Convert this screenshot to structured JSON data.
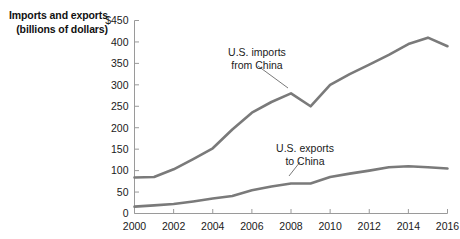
{
  "axis_title": {
    "line1": "Imports and exports",
    "line2": "(billions of dollars)"
  },
  "chart_data": {
    "type": "line",
    "title": "",
    "xlabel": "",
    "ylabel": "Imports and exports (billions of dollars)",
    "xlim": [
      2000,
      2016
    ],
    "ylim": [
      0,
      450
    ],
    "grid": false,
    "legend": "annotations-on-plot",
    "line_color": "#7a7a7a",
    "axis_color": "#9a9a9a",
    "x": [
      2000,
      2001,
      2002,
      2003,
      2004,
      2005,
      2006,
      2007,
      2008,
      2009,
      2010,
      2011,
      2012,
      2013,
      2014,
      2015,
      2016
    ],
    "xticks": [
      "2000",
      "2002",
      "2004",
      "2006",
      "2008",
      "2010",
      "2012",
      "2014",
      "2016"
    ],
    "yticks": [
      "$450",
      "400",
      "350",
      "300",
      "250",
      "200",
      "150",
      "100",
      "50",
      "0"
    ],
    "ytick_values": [
      450,
      400,
      350,
      300,
      250,
      200,
      150,
      100,
      50,
      0
    ],
    "series": [
      {
        "name": "U.S. imports from China",
        "values": [
          84,
          85,
          103,
          127,
          152,
          196,
          235,
          260,
          280,
          250,
          300,
          325,
          347,
          370,
          395,
          410,
          390
        ]
      },
      {
        "name": "U.S. exports to China",
        "values": [
          16,
          19,
          22,
          28,
          35,
          41,
          54,
          63,
          70,
          70,
          85,
          93,
          100,
          108,
          110,
          108,
          105
        ]
      }
    ],
    "annotations": [
      {
        "label_line1": "U.S. imports",
        "label_line2": "from China",
        "target_year": 2008,
        "target_value": 280
      },
      {
        "label_line1": "U.S. exports",
        "label_line2": "to China",
        "target_year": 2010,
        "target_value": 85
      }
    ]
  }
}
